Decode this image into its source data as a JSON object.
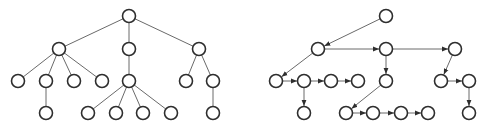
{
  "diagram": {
    "canvas": {
      "width": 482,
      "height": 126,
      "background": "#ffffff"
    },
    "style": {
      "node_radius": 6.5,
      "node_stroke": "#2e2e2e",
      "edge_stroke": "#6a6a6a",
      "arrow_fill": "#2e2e2e"
    },
    "trees": [
      {
        "id": "left-tree",
        "kind": "undirected-tree",
        "nodes": [
          {
            "id": "a",
            "x": 129,
            "y": 16
          },
          {
            "id": "b",
            "x": 59,
            "y": 49
          },
          {
            "id": "c",
            "x": 129,
            "y": 49
          },
          {
            "id": "d",
            "x": 199,
            "y": 49
          },
          {
            "id": "e",
            "x": 18,
            "y": 81
          },
          {
            "id": "f",
            "x": 46,
            "y": 81
          },
          {
            "id": "g",
            "x": 74,
            "y": 81
          },
          {
            "id": "h",
            "x": 102,
            "y": 81
          },
          {
            "id": "i",
            "x": 129,
            "y": 81
          },
          {
            "id": "j",
            "x": 186,
            "y": 81
          },
          {
            "id": "k",
            "x": 213,
            "y": 81
          },
          {
            "id": "l",
            "x": 46,
            "y": 113
          },
          {
            "id": "m",
            "x": 88,
            "y": 113
          },
          {
            "id": "n",
            "x": 116,
            "y": 113
          },
          {
            "id": "o",
            "x": 143,
            "y": 113
          },
          {
            "id": "p",
            "x": 171,
            "y": 113
          },
          {
            "id": "q",
            "x": 213,
            "y": 113
          }
        ],
        "edges": [
          [
            "a",
            "b"
          ],
          [
            "a",
            "c"
          ],
          [
            "a",
            "d"
          ],
          [
            "b",
            "e"
          ],
          [
            "b",
            "f"
          ],
          [
            "b",
            "g"
          ],
          [
            "b",
            "h"
          ],
          [
            "c",
            "i"
          ],
          [
            "d",
            "j"
          ],
          [
            "d",
            "k"
          ],
          [
            "f",
            "l"
          ],
          [
            "i",
            "m"
          ],
          [
            "i",
            "n"
          ],
          [
            "i",
            "o"
          ],
          [
            "i",
            "p"
          ],
          [
            "k",
            "q"
          ]
        ]
      },
      {
        "id": "right-tree",
        "kind": "directed-first-child-next-sibling",
        "nodes": [
          {
            "id": "a",
            "x": 386,
            "y": 16
          },
          {
            "id": "b",
            "x": 318,
            "y": 49
          },
          {
            "id": "c",
            "x": 386,
            "y": 49
          },
          {
            "id": "d",
            "x": 455,
            "y": 49
          },
          {
            "id": "e",
            "x": 276,
            "y": 81
          },
          {
            "id": "f",
            "x": 304,
            "y": 81
          },
          {
            "id": "g",
            "x": 331,
            "y": 81
          },
          {
            "id": "h",
            "x": 358,
            "y": 81
          },
          {
            "id": "i",
            "x": 386,
            "y": 81
          },
          {
            "id": "j",
            "x": 441,
            "y": 81
          },
          {
            "id": "k",
            "x": 469,
            "y": 81
          },
          {
            "id": "l",
            "x": 304,
            "y": 113
          },
          {
            "id": "m",
            "x": 346,
            "y": 113
          },
          {
            "id": "n",
            "x": 373,
            "y": 113
          },
          {
            "id": "o",
            "x": 401,
            "y": 113
          },
          {
            "id": "p",
            "x": 428,
            "y": 113
          },
          {
            "id": "q",
            "x": 469,
            "y": 113
          }
        ],
        "edges": [
          [
            "a",
            "b"
          ],
          [
            "b",
            "c"
          ],
          [
            "c",
            "d"
          ],
          [
            "b",
            "e"
          ],
          [
            "e",
            "f"
          ],
          [
            "f",
            "g"
          ],
          [
            "g",
            "h"
          ],
          [
            "c",
            "i"
          ],
          [
            "d",
            "j"
          ],
          [
            "j",
            "k"
          ],
          [
            "f",
            "l"
          ],
          [
            "i",
            "m"
          ],
          [
            "m",
            "n"
          ],
          [
            "n",
            "o"
          ],
          [
            "o",
            "p"
          ],
          [
            "k",
            "q"
          ]
        ]
      }
    ]
  }
}
